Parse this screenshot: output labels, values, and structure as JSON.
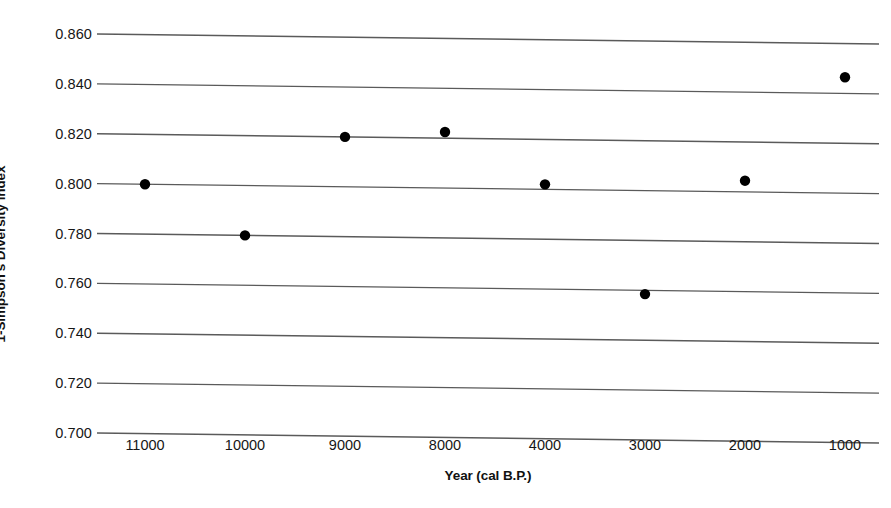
{
  "chart_data": {
    "type": "scatter",
    "title": "",
    "subtitle": "",
    "xlabel": "Year (cal B.P.)",
    "ylabel": "1-Simpson's Diversity Index",
    "categories": [
      "11000",
      "10000",
      "9000",
      "8000",
      "4000",
      "3000",
      "2000",
      "1000"
    ],
    "values": [
      0.8,
      0.78,
      0.82,
      0.8225,
      0.802,
      0.7585,
      0.8045,
      0.8465
    ],
    "series": [
      {
        "name": "1-Simpson's Diversity Index",
        "values": [
          0.8,
          0.78,
          0.82,
          0.8225,
          0.802,
          0.7585,
          0.8045,
          0.8465
        ]
      }
    ],
    "ylim": [
      0.7,
      0.86
    ],
    "ytick_labels": [
      "0.860",
      "0.840",
      "0.820",
      "0.800",
      "0.780",
      "0.760",
      "0.740",
      "0.720",
      "0.700"
    ],
    "ytick_values": [
      0.86,
      0.84,
      0.82,
      0.8,
      0.78,
      0.76,
      0.74,
      0.72,
      0.7
    ],
    "xtick_labels": [
      "11000",
      "10000",
      "9000",
      "8000",
      "4000",
      "3000",
      "2000",
      "1000"
    ],
    "grid": "horizontal",
    "legend": "none",
    "marker": "filled-circle",
    "marker_color": "#000000",
    "gridline_color": "#5a5a5a",
    "background_color": "#ffffff",
    "annotations": []
  },
  "axes": {
    "y_title": "1-Simpson's Diversity Index",
    "x_title": "Year (cal B.P.)"
  }
}
